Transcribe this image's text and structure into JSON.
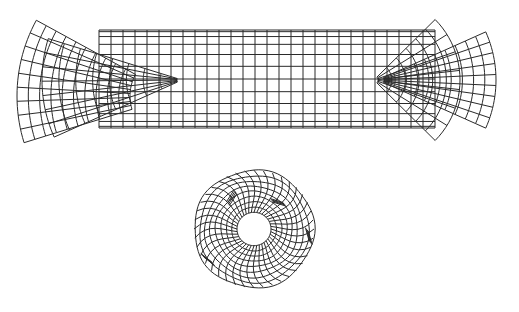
{
  "figure": {
    "stroke_color": "#2a2a2a",
    "background": "#ffffff"
  },
  "meshes": [
    {
      "id": "cylinder",
      "label": "Cylindrical tube mesh (side view)",
      "axial_divisions": 28,
      "circumferential_divisions": 24
    },
    {
      "id": "left-fan",
      "label": "Left flared fan mesh",
      "radial_divisions": 10,
      "angular_divisions": 9
    },
    {
      "id": "left-cone",
      "label": "Left inner cone mesh",
      "radial_divisions": 8,
      "angular_divisions": 7
    },
    {
      "id": "right-fan",
      "label": "Right flared fan mesh",
      "radial_divisions": 10,
      "angular_divisions": 9
    },
    {
      "id": "right-cone",
      "label": "Right inner cone mesh",
      "radial_divisions": 6,
      "angular_divisions": 7
    },
    {
      "id": "ring",
      "label": "Annular ring mesh (end view)",
      "radial_divisions": 8,
      "angular_divisions": 40
    }
  ]
}
